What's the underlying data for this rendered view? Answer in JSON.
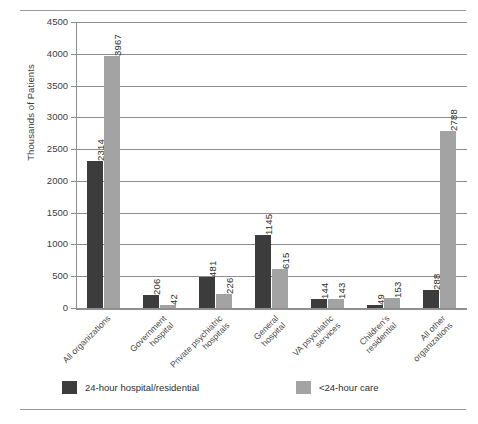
{
  "chart_data": {
    "type": "bar",
    "title": "",
    "xlabel": "",
    "ylabel": "Thousands of Patients",
    "ylim": [
      0,
      4500
    ],
    "ytick_step": 500,
    "yticks": [
      "4500",
      "4000",
      "3500",
      "3000",
      "2500",
      "2000",
      "1500",
      "1000",
      "500",
      "0"
    ],
    "grid": true,
    "legend_position": "bottom",
    "categories": [
      "All organizations",
      "Government hospital",
      "Private psychiatric hospitals",
      "General hospital",
      "VA psychiatric services",
      "Children's residential",
      "All other organizations"
    ],
    "category_lines": [
      [
        "All organizations"
      ],
      [
        "Government",
        "hospital"
      ],
      [
        "Private psychiatric",
        "hospitals"
      ],
      [
        "General",
        "hospital"
      ],
      [
        "VA psychiatric",
        "services"
      ],
      [
        "Children's",
        "residential"
      ],
      [
        "All other",
        "organizations"
      ]
    ],
    "series": [
      {
        "name": "24-hour hospital/residential",
        "color": "#3c3c3c",
        "values": [
          2314,
          206,
          481,
          1145,
          144,
          49,
          288
        ]
      },
      {
        "name": "<24-hour care",
        "color": "#a3a3a3",
        "values": [
          3967,
          42,
          226,
          615,
          143,
          153,
          2788
        ]
      }
    ]
  }
}
